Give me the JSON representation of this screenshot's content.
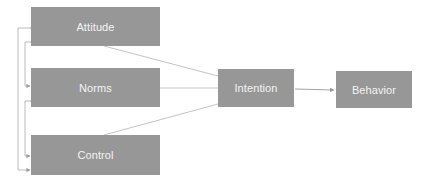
{
  "diagram": {
    "nodes": [
      {
        "id": "attitude",
        "label": "Attitude"
      },
      {
        "id": "norms",
        "label": "Norms"
      },
      {
        "id": "control",
        "label": "Control"
      },
      {
        "id": "intention",
        "label": "Intention"
      },
      {
        "id": "behavior",
        "label": "Behavior"
      }
    ],
    "edges": [
      {
        "from": "attitude",
        "to": "intention"
      },
      {
        "from": "norms",
        "to": "intention"
      },
      {
        "from": "control",
        "to": "intention"
      },
      {
        "from": "intention",
        "to": "behavior",
        "arrow": true
      },
      {
        "from": "attitude",
        "to": "norms",
        "bidirectional": true
      },
      {
        "from": "norms",
        "to": "control",
        "bidirectional": true
      },
      {
        "from": "attitude",
        "to": "control",
        "bidirectional": true
      }
    ],
    "colors": {
      "box": "#979797",
      "text": "#f4f4f4",
      "line": "#a8a8a8"
    }
  }
}
